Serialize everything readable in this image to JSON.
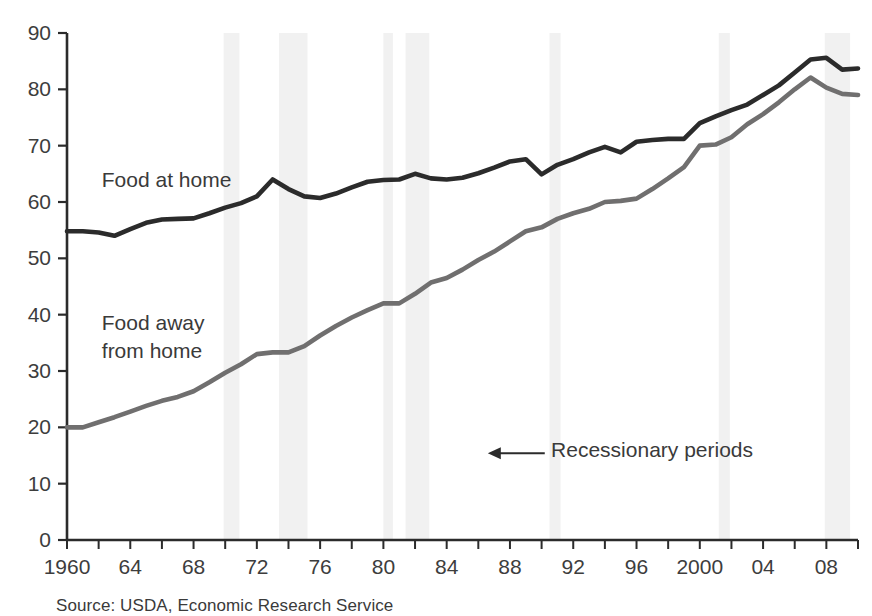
{
  "chart_data": {
    "type": "line",
    "title": "",
    "subtitle": "",
    "xlabel": "",
    "ylabel": "",
    "xlim": [
      1960,
      2010
    ],
    "ylim": [
      0,
      90
    ],
    "grid": false,
    "legend_position": "inline-labels",
    "y_ticks": [
      0,
      10,
      20,
      30,
      40,
      50,
      60,
      70,
      80,
      90
    ],
    "y_tick_labels": [
      "0",
      "10",
      "20",
      "30",
      "40",
      "50",
      "60",
      "70",
      "80",
      "90"
    ],
    "x_tick_step": 2,
    "x_tick_labels": [
      {
        "year": 1960,
        "label": "1960"
      },
      {
        "year": 1964,
        "label": "64"
      },
      {
        "year": 1968,
        "label": "68"
      },
      {
        "year": 1972,
        "label": "72"
      },
      {
        "year": 1976,
        "label": "76"
      },
      {
        "year": 1980,
        "label": "80"
      },
      {
        "year": 1984,
        "label": "84"
      },
      {
        "year": 1988,
        "label": "88"
      },
      {
        "year": 1992,
        "label": "92"
      },
      {
        "year": 1996,
        "label": "96"
      },
      {
        "year": 2000,
        "label": "2000"
      },
      {
        "year": 2004,
        "label": "04"
      },
      {
        "year": 2008,
        "label": "08"
      }
    ],
    "x": [
      1960,
      1961,
      1962,
      1963,
      1964,
      1965,
      1966,
      1967,
      1968,
      1969,
      1970,
      1971,
      1972,
      1973,
      1974,
      1975,
      1976,
      1977,
      1978,
      1979,
      1980,
      1981,
      1982,
      1983,
      1984,
      1985,
      1986,
      1987,
      1988,
      1989,
      1990,
      1991,
      1992,
      1993,
      1994,
      1995,
      1996,
      1997,
      1998,
      1999,
      2000,
      2001,
      2002,
      2003,
      2004,
      2005,
      2006,
      2007,
      2008,
      2009,
      2010
    ],
    "series": [
      {
        "name": "Food at home",
        "color": "#2b2b2b",
        "label_position": {
          "year": 1962.2,
          "value": 62.6
        },
        "values": [
          54.8,
          54.8,
          54.6,
          54.0,
          55.2,
          56.3,
          56.9,
          57.0,
          57.1,
          58.0,
          59.0,
          59.8,
          61.0,
          64.0,
          62.3,
          61.0,
          60.7,
          61.5,
          62.6,
          63.6,
          63.9,
          64.0,
          65.0,
          64.2,
          64.0,
          64.3,
          65.1,
          66.1,
          67.2,
          67.6,
          64.9,
          66.6,
          67.6,
          68.8,
          69.8,
          68.8,
          70.7,
          71.0,
          71.2,
          71.2,
          74.0,
          75.2,
          76.3,
          77.3,
          79.0,
          80.7,
          83.0,
          85.3,
          85.6,
          83.5,
          83.7
        ]
      },
      {
        "name": "Food away from home",
        "color": "#706f6f",
        "label_position": {
          "year": 1962.2,
          "value": 37.3
        },
        "values": [
          20.0,
          20.0,
          20.9,
          21.8,
          22.8,
          23.8,
          24.7,
          25.4,
          26.4,
          28.0,
          29.7,
          31.2,
          33.0,
          33.3,
          33.3,
          34.4,
          36.3,
          38.0,
          39.5,
          40.8,
          42.0,
          42.0,
          43.7,
          45.7,
          46.5,
          48.0,
          49.7,
          51.2,
          53.0,
          54.8,
          55.5,
          57.0,
          58.0,
          58.8,
          60.0,
          60.2,
          60.6,
          62.3,
          64.2,
          66.2,
          70.0,
          70.2,
          71.5,
          73.8,
          75.6,
          77.7,
          80.0,
          82.1,
          80.3,
          79.2,
          79.0
        ]
      }
    ],
    "recession_bands": [
      {
        "start": 1969.9,
        "end": 1970.9
      },
      {
        "start": 1973.4,
        "end": 1975.2
      },
      {
        "start": 1980.0,
        "end": 1980.6
      },
      {
        "start": 1981.4,
        "end": 1982.9
      },
      {
        "start": 1990.5,
        "end": 1991.2
      },
      {
        "start": 2001.2,
        "end": 2001.9
      },
      {
        "start": 2007.9,
        "end": 2009.5
      }
    ],
    "recession_band_color": "#f1f1f1",
    "annotations": [
      {
        "name": "recessionary-periods",
        "text": "Recessionary periods",
        "text_anchor_year": 1990.6,
        "text_anchor_value": 14.7,
        "arrow_from_year": 1990.2,
        "arrow_to_year": 1986.6,
        "arrow_value": 15.4
      }
    ]
  },
  "series_labels": {
    "food_at_home": "Food at home",
    "food_away_line1": "Food away",
    "food_away_line2": "from home"
  },
  "annotation": {
    "recessionary_periods": "Recessionary periods"
  },
  "source": {
    "note": "Source: USDA, Economic Research Service"
  }
}
